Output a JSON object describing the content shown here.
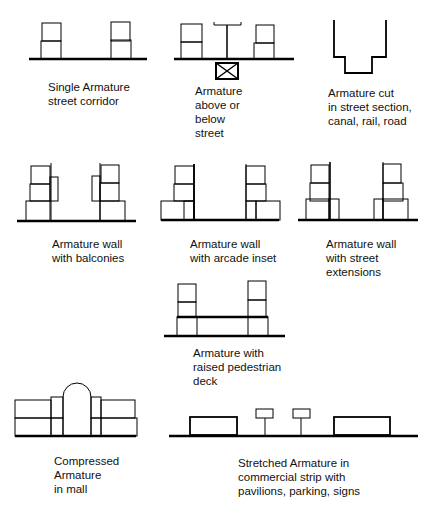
{
  "diagram": {
    "panels": [
      {
        "id": "single",
        "caption": "Single Armature\nstreet corridor"
      },
      {
        "id": "above-below",
        "caption": "Armature\nabove or\nbelow\nstreet"
      },
      {
        "id": "cut",
        "caption": "Armature cut\nin street section,\ncanal, rail, road"
      },
      {
        "id": "balconies",
        "caption": "Armature wall\nwith balconies"
      },
      {
        "id": "arcade",
        "caption": "Armature wall\nwith arcade inset"
      },
      {
        "id": "extensions",
        "caption": "Armature wall\nwith street\nextensions"
      },
      {
        "id": "deck",
        "caption": "Armature with\nraised pedestrian\ndeck"
      },
      {
        "id": "mall",
        "caption": "Compressed\nArmature\nin mall"
      },
      {
        "id": "strip",
        "caption": "Stretched Armature in\ncommercial strip with\npavilions, parking, signs"
      }
    ],
    "colors": {
      "line": "#000000",
      "background": "#ffffff"
    }
  }
}
